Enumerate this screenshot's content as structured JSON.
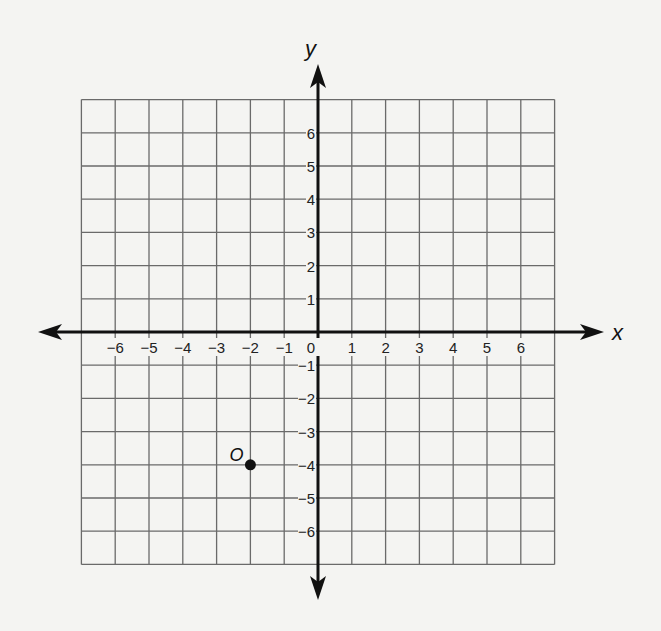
{
  "diagram": {
    "type": "coordinate-plane",
    "x_axis_label": "x",
    "y_axis_label": "y",
    "x_ticks": [
      "−6",
      "−5",
      "−4",
      "−3",
      "−2",
      "−1",
      "0",
      "1",
      "2",
      "3",
      "4",
      "5",
      "6"
    ],
    "y_ticks": [
      "6",
      "5",
      "4",
      "3",
      "2",
      "1",
      "−1",
      "−2",
      "−3",
      "−4",
      "−5",
      "−6"
    ],
    "grid_range": {
      "x": [
        -7,
        7
      ],
      "y": [
        -7,
        7
      ]
    },
    "points": [
      {
        "label": "O",
        "x": -2,
        "y": -4
      }
    ],
    "colors": {
      "grid": "#6a6a6a",
      "axis": "#111111",
      "background": "#f4f4f2"
    }
  }
}
